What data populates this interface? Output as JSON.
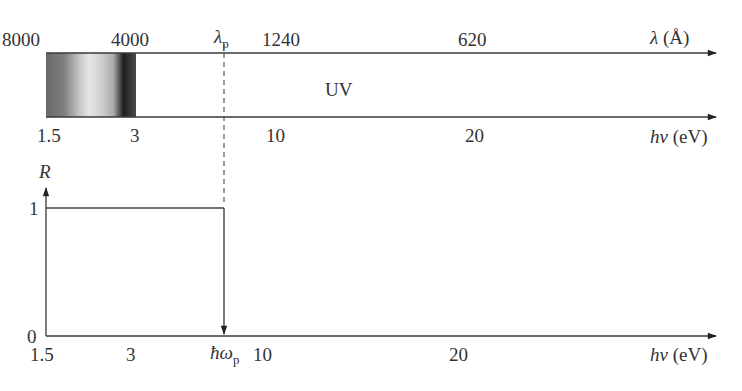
{
  "top_panel": {
    "wavelength_ticks": [
      {
        "label": "8000",
        "x": 46
      },
      {
        "label": "4000",
        "x": 107
      },
      {
        "label": "1240",
        "x": 285
      },
      {
        "label": "620",
        "x": 491
      }
    ],
    "wavelength_axis_label": {
      "symbol": "λ",
      "unit": "(Å)"
    },
    "energy_ticks": [
      {
        "label": "1.5",
        "x": 46
      },
      {
        "label": "3",
        "x": 136
      },
      {
        "label": "10",
        "x": 277
      },
      {
        "label": "20",
        "x": 476
      }
    ],
    "energy_axis_label": {
      "symbol": "hν",
      "unit": "(eV)"
    },
    "region_label": "UV",
    "plasma_wavelength_label": {
      "symbol": "λ",
      "subscript": "p"
    },
    "visible_band": {
      "from_ev": 1.5,
      "to_ev": 3
    }
  },
  "bottom_panel": {
    "y_axis_label": "R",
    "y_ticks": [
      {
        "label": "1"
      },
      {
        "label": "0"
      }
    ],
    "x_ticks": [
      {
        "label": "1.5"
      },
      {
        "label": "3"
      },
      {
        "label": "10"
      },
      {
        "label": "20"
      }
    ],
    "x_axis_label": {
      "symbol": "hν",
      "unit": "(eV)"
    },
    "plasma_energy_label": {
      "symbol": "ħω",
      "subscript": "p"
    }
  },
  "colors": {
    "line": "#3a3a3a",
    "dashed": "#555555",
    "background": "#ffffff"
  }
}
